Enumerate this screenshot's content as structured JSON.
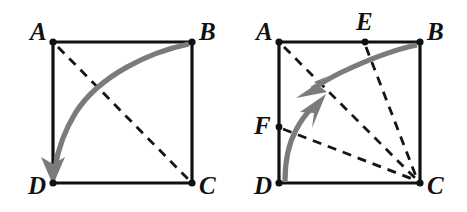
{
  "figure": {
    "width": 467,
    "height": 212,
    "background": "#ffffff",
    "colors": {
      "edge": "#111111",
      "dashed": "#141414",
      "arc": "#7b7b7b",
      "label": "#111111"
    }
  },
  "panels": [
    {
      "id": "left",
      "name": "square-abcd-diagonal",
      "square": {
        "A": {
          "x": 53,
          "y": 42
        },
        "B": {
          "x": 192,
          "y": 42
        },
        "C": {
          "x": 192,
          "y": 183
        },
        "D": {
          "x": 53,
          "y": 183
        }
      },
      "labels": [
        {
          "text": "A",
          "x": 30,
          "y": 40
        },
        {
          "text": "B",
          "x": 199,
          "y": 40
        },
        {
          "text": "C",
          "x": 199,
          "y": 194
        },
        {
          "text": "D",
          "x": 28,
          "y": 194
        }
      ],
      "edges": [
        {
          "name": "edge-AB",
          "from": "A",
          "to": "B"
        },
        {
          "name": "edge-BC",
          "from": "B",
          "to": "C"
        },
        {
          "name": "edge-CD",
          "from": "C",
          "to": "D"
        },
        {
          "name": "edge-DA",
          "from": "D",
          "to": "A"
        }
      ],
      "dashed_lines": [
        {
          "name": "diagonal-AC",
          "from": "A",
          "to": "C"
        }
      ],
      "arcs": [
        {
          "name": "arc-B-to-D",
          "from": "B",
          "to": "D",
          "direction": "clockwise-downward",
          "arrow_at": "D",
          "arrow_points": "down"
        }
      ]
    },
    {
      "id": "right",
      "name": "square-abcd-with-E-F-and-fold-arcs",
      "square": {
        "A": {
          "x": 279,
          "y": 42
        },
        "B": {
          "x": 420,
          "y": 42
        },
        "C": {
          "x": 420,
          "y": 183
        },
        "D": {
          "x": 279,
          "y": 183
        }
      },
      "points": [
        {
          "label": "E",
          "on": "edge-AB",
          "x": 365,
          "y": 42
        },
        {
          "label": "F",
          "on": "edge-DA",
          "x": 279,
          "y": 127
        }
      ],
      "labels": [
        {
          "text": "A",
          "x": 256,
          "y": 40
        },
        {
          "text": "B",
          "x": 427,
          "y": 40
        },
        {
          "text": "C",
          "x": 427,
          "y": 194
        },
        {
          "text": "D",
          "x": 254,
          "y": 194
        },
        {
          "text": "E",
          "x": 356,
          "y": 30
        },
        {
          "text": "F",
          "x": 254,
          "y": 134
        }
      ],
      "edges": [
        {
          "name": "edge-AB",
          "from": "A",
          "to": "B"
        },
        {
          "name": "edge-BC",
          "from": "B",
          "to": "C"
        },
        {
          "name": "edge-CD",
          "from": "C",
          "to": "D"
        },
        {
          "name": "edge-DA",
          "from": "D",
          "to": "A"
        }
      ],
      "dashed_lines": [
        {
          "name": "line-AC",
          "from": "A",
          "to": "C"
        },
        {
          "name": "line-EC",
          "from": "E",
          "to": "C"
        },
        {
          "name": "line-FC",
          "from": "F",
          "to": "C"
        }
      ],
      "arcs": [
        {
          "name": "arc-B-inward",
          "from": "B",
          "to": "interior-upper",
          "direction": "leftward-inward",
          "arrow_at": "interior-upper",
          "arrow_points": "down-left"
        },
        {
          "name": "arc-D-inward",
          "from": "D",
          "to": "interior-lower",
          "direction": "upward-inward",
          "arrow_at": "interior-lower",
          "arrow_points": "up-right"
        }
      ]
    }
  ]
}
